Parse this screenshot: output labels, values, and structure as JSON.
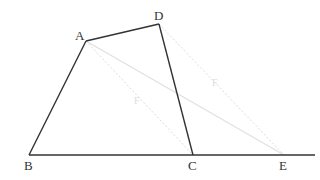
{
  "diagram": {
    "points": {
      "A": {
        "x": 86,
        "y": 41,
        "label": "A"
      },
      "B": {
        "x": 29,
        "y": 155,
        "label": "B"
      },
      "C": {
        "x": 193,
        "y": 155,
        "label": "C"
      },
      "D": {
        "x": 159,
        "y": 24,
        "label": "D"
      },
      "E": {
        "x": 284,
        "y": 155,
        "label": "E"
      }
    },
    "solid_segments": [
      "AB",
      "AD",
      "DC",
      "BC-extended"
    ],
    "faint_segments": [
      "AC (dotted)",
      "DE (dotted)",
      "AE"
    ],
    "faint_marks": [
      "F",
      "F"
    ],
    "colors": {
      "line": "#333333",
      "faint": "#dddddd"
    }
  }
}
